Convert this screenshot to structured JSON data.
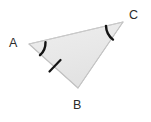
{
  "figure": {
    "kind": "geometry-diagram",
    "shape": "triangle",
    "background_color": "#ffffff",
    "canvas": {
      "width": 151,
      "height": 122
    }
  },
  "triangle": {
    "fill_color": "#e9e9e9",
    "stroke_color": "#c6c6c6",
    "stroke_width": 1,
    "vertices": [
      {
        "name": "A",
        "x": 29,
        "y": 44
      },
      {
        "name": "B",
        "x": 78,
        "y": 88
      },
      {
        "name": "C",
        "x": 123,
        "y": 22
      }
    ],
    "path": "M 29 44 L 123 22 L 78 88 Z"
  },
  "labels": {
    "a": "A",
    "b": "B",
    "c": "C",
    "color": "#2b2b2b"
  },
  "marks": {
    "color": "#141414",
    "angle_arcs": [
      {
        "at_vertex": "A",
        "path": "M 45.5 42.2 A 17 17 0 0 1 40.0 55.2",
        "stroke_width": 2.4
      },
      {
        "at_vertex": "C",
        "path": "M 106.0 25.9 A 18 18 0 0 0 113.0 39.6",
        "stroke_width": 2.4
      }
    ],
    "side_ticks": [
      {
        "on_side": "AB",
        "x1": 49.5,
        "y1": 71.5,
        "x2": 60.5,
        "y2": 60.0,
        "stroke_width": 2.2
      }
    ]
  }
}
